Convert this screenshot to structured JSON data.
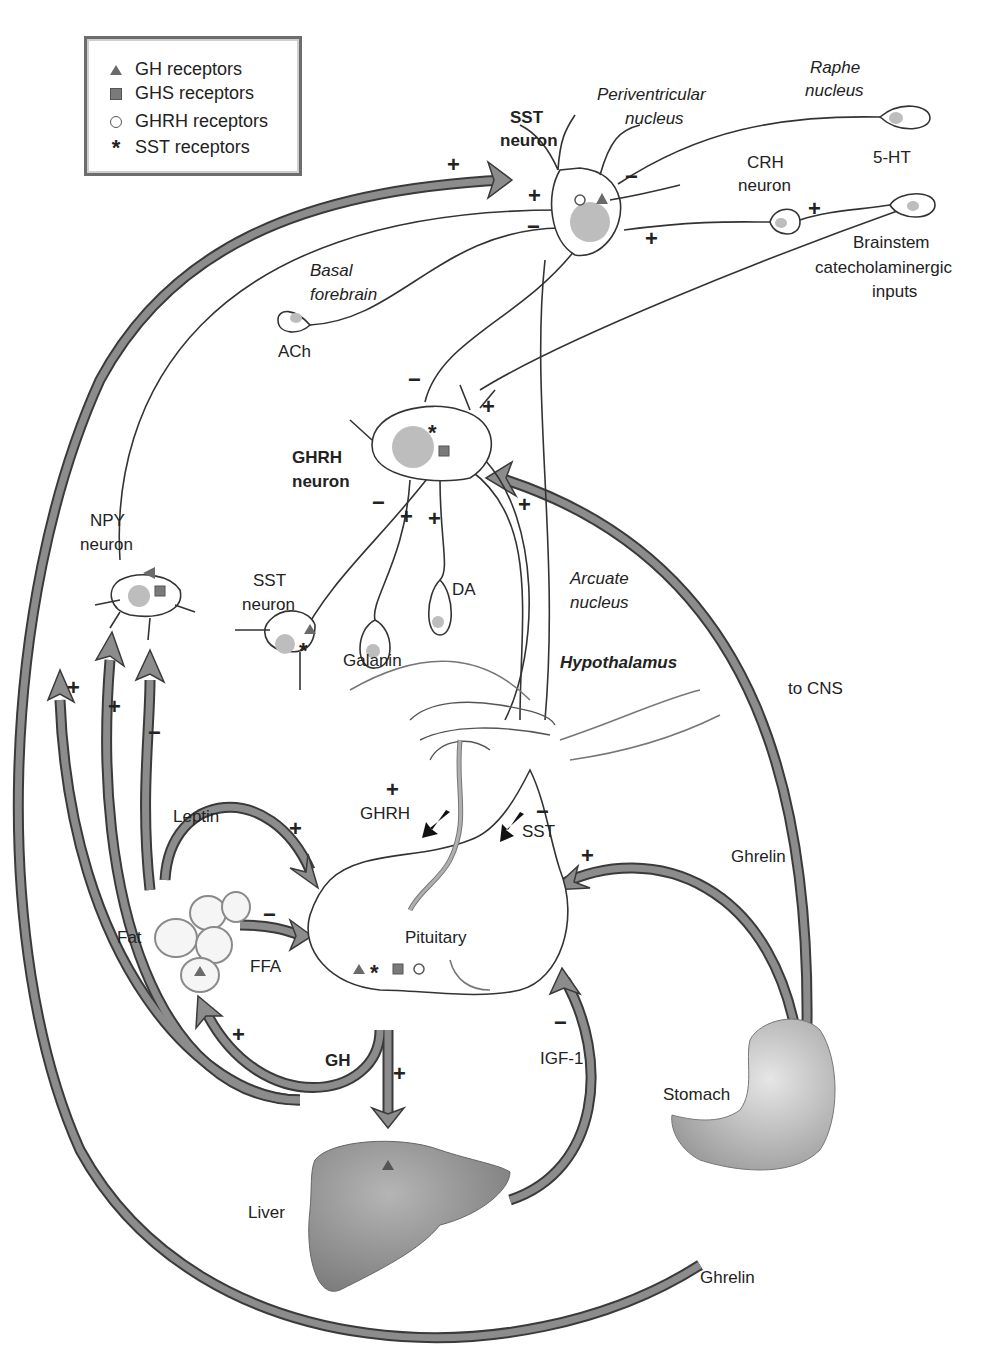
{
  "legend": {
    "items": [
      {
        "symbol": "triangle",
        "label": "GH receptors"
      },
      {
        "symbol": "square",
        "label": "GHS receptors"
      },
      {
        "symbol": "circle",
        "label": "GHRH receptors"
      },
      {
        "symbol": "star",
        "label": "SST receptors"
      }
    ]
  },
  "labels": {
    "sst_neuron_top": [
      "SST",
      "neuron"
    ],
    "periventricular": [
      "Periventricular",
      "nucleus"
    ],
    "raphe": [
      "Raphe",
      "nucleus"
    ],
    "five_ht": "5-HT",
    "crh_neuron": [
      "CRH",
      "neuron"
    ],
    "brainstem": [
      "Brainstem",
      "catecholaminergic",
      "inputs"
    ],
    "basal_forebrain": [
      "Basal",
      "forebrain"
    ],
    "ach": "ACh",
    "ghrh_neuron": [
      "GHRH",
      "neuron"
    ],
    "npy_neuron": [
      "NPY",
      "neuron"
    ],
    "sst_neuron_small": [
      "SST",
      "neuron"
    ],
    "da": "DA",
    "galanin": "Galanin",
    "arcuate": [
      "Arcuate",
      "nucleus"
    ],
    "hypothalamus": "Hypothalamus",
    "to_cns": "to CNS",
    "leptin": "Leptin",
    "ghrh_release": "GHRH",
    "sst_release": "SST",
    "ghrelin_upper": "Ghrelin",
    "fat": "Fat",
    "ffa": "FFA",
    "pituitary": "Pituitary",
    "igf1": "IGF-1",
    "gh": "GH",
    "stomach": "Stomach",
    "liver": "Liver",
    "ghrelin_lower": "Ghrelin"
  },
  "signs": {
    "plus": "+",
    "minus": "−"
  },
  "colors": {
    "arrow_fill": "#8c8c8c",
    "arrow_stroke": "#3a3a3a",
    "nucleus": "#bdbdbd",
    "receptor": "#6a6a6a",
    "liver": "#9a9a9a",
    "stomach": "#c9c9c9"
  }
}
